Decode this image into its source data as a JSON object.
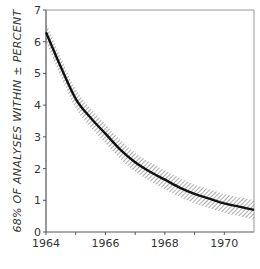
{
  "chart_data": {
    "type": "line",
    "title": "",
    "xlabel": "",
    "ylabel": "68% OF ANALYSES WITHIN ± PERCENT",
    "xlim": [
      1964,
      1971
    ],
    "ylim": [
      0,
      7
    ],
    "x_ticks": [
      "1964",
      "1966",
      "1968",
      "1970"
    ],
    "x_minor_ticks": [
      1965,
      1967,
      1969
    ],
    "y_ticks": [
      "0",
      "1",
      "2",
      "3",
      "4",
      "5",
      "6",
      "7"
    ],
    "grid": false,
    "legend": null,
    "series": [
      {
        "name": "trend",
        "style": "solid black line with hatched uncertainty band",
        "x": [
          1964,
          1964.5,
          1965,
          1965.5,
          1966,
          1966.5,
          1967,
          1967.5,
          1968,
          1968.5,
          1969,
          1969.5,
          1970,
          1970.5,
          1971
        ],
        "values": [
          6.3,
          5.2,
          4.2,
          3.6,
          3.1,
          2.6,
          2.2,
          1.9,
          1.65,
          1.4,
          1.2,
          1.05,
          0.9,
          0.8,
          0.7
        ],
        "band_halfwidth": 0.3
      }
    ]
  },
  "colors": {
    "line": "#111111",
    "band": "#9a9a9a",
    "axis": "#555555"
  }
}
